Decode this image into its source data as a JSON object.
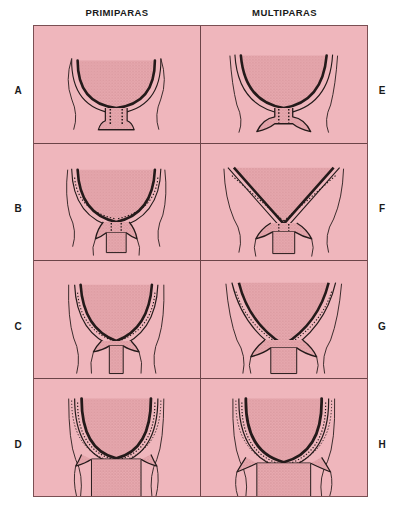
{
  "figure": {
    "columns": [
      {
        "key": "primiparas",
        "label": "PRIMIPARAS"
      },
      {
        "key": "multiparas",
        "label": "MULTIPARAS"
      }
    ],
    "background_color": "#efb6bc",
    "frame_color": "#7a4f53",
    "divider_color": "#6b4448",
    "ink_color": "#241a1a",
    "stipple_color": "#c98b90",
    "page_background": "#ffffff"
  },
  "panels": [
    {
      "id": "A",
      "label": "A",
      "column": "primiparas",
      "row": 1,
      "stage": "No effacement, cervix long and closed",
      "canal_marking": "dotted-closed-canal"
    },
    {
      "id": "B",
      "label": "B",
      "column": "primiparas",
      "row": 2,
      "stage": "Partial effacement, canal shortening",
      "canal_marking": "dotted-partial-canal"
    },
    {
      "id": "C",
      "label": "C",
      "column": "primiparas",
      "row": 3,
      "stage": "Nearly complete effacement",
      "canal_marking": "dotted-thin-canal"
    },
    {
      "id": "D",
      "label": "D",
      "column": "primiparas",
      "row": 4,
      "stage": "Complete effacement with dilatation",
      "canal_marking": "dotted-effaced-rim"
    },
    {
      "id": "E",
      "label": "E",
      "column": "multiparas",
      "row": 1,
      "stage": "No effacement, patulous external os",
      "canal_marking": "dotted-closed-canal"
    },
    {
      "id": "F",
      "label": "F",
      "column": "multiparas",
      "row": 2,
      "stage": "Partial effacement, V-shaped lower segment",
      "canal_marking": "dotted-partial-canal"
    },
    {
      "id": "G",
      "label": "G",
      "column": "multiparas",
      "row": 3,
      "stage": "Advanced effacement, open os",
      "canal_marking": "dotted-thin-canal"
    },
    {
      "id": "H",
      "label": "H",
      "column": "multiparas",
      "row": 4,
      "stage": "Complete effacement with dilatation",
      "canal_marking": "dotted-effaced-rim"
    }
  ]
}
